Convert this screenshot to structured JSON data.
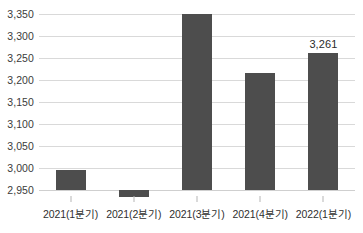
{
  "chart_data": {
    "type": "bar",
    "title": "",
    "subtitle": "",
    "xlabel": "",
    "ylabel": "",
    "categories": [
      "2021(1분기)",
      "2021(2분기)",
      "2021(3분기)",
      "2021(4분기)",
      "2022(1분기)"
    ],
    "values": [
      2995,
      2935,
      3350,
      3216,
      3261
    ],
    "ylim": [
      2950,
      3350
    ],
    "y_ticks": [
      2950,
      3000,
      3050,
      3100,
      3150,
      3200,
      3250,
      3300,
      3350
    ],
    "y_tick_labels": [
      "2,950",
      "3,000",
      "3,050",
      "3,100",
      "3,150",
      "3,200",
      "3,250",
      "3,300",
      "3,350"
    ],
    "grid": true,
    "legend": false,
    "legend_position": "none",
    "bar_color": "#4d4d4d",
    "grid_color": "#d9d9d9",
    "axis_text_color": "#2f2f2f",
    "data_labels": [
      {
        "category_index": 4,
        "text": "3,261",
        "value": 3261
      }
    ]
  },
  "axis": {
    "y_tick_labels": [
      "3,350",
      "3,300",
      "3,250",
      "3,200",
      "3,150",
      "3,100",
      "3,050",
      "3,000",
      "2,950"
    ],
    "x_tick_labels": [
      "2021(1분기)",
      "2021(2분기)",
      "2021(3분기)",
      "2021(4분기)",
      "2022(1분기)"
    ]
  }
}
